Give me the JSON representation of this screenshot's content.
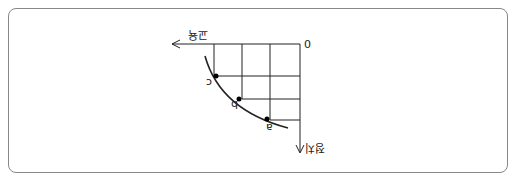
{
  "diagram": {
    "orientation": "rotated 180 degrees",
    "origin_label": "0",
    "x_axis_label": "교육",
    "y_axis_label": "정치",
    "points": [
      "a",
      "b",
      "c"
    ],
    "curve": "production possibilities frontier"
  }
}
